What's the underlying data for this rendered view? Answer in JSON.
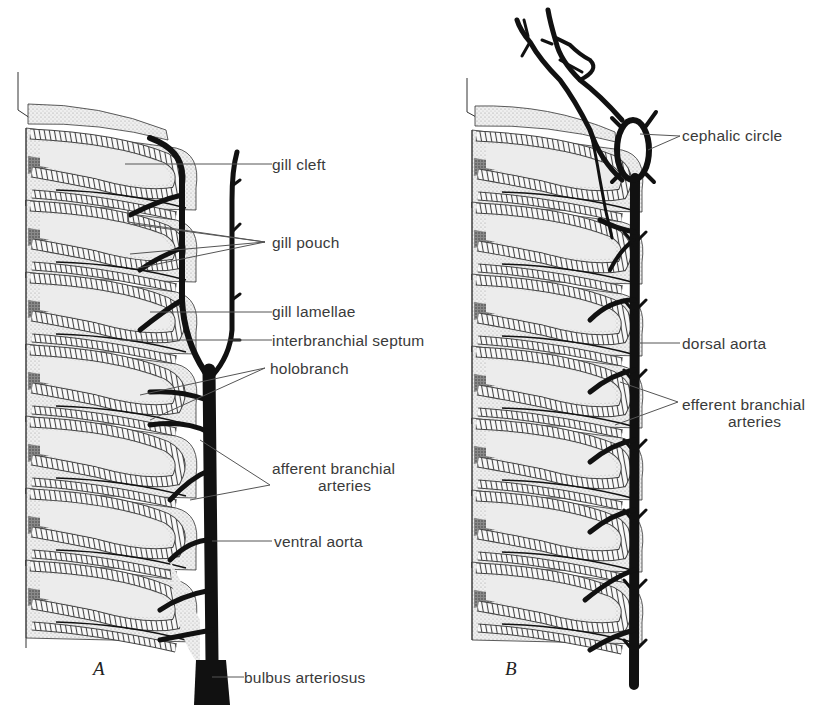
{
  "figure": {
    "panels": [
      {
        "letter": "A",
        "labels": {
          "gill_cleft": "gill cleft",
          "gill_pouch": "gill pouch",
          "gill_lamellae": "gill lamellae",
          "interbranchial_septum": "interbranchial septum",
          "holobranch": "holobranch",
          "afferent_line1": "afferent branchial",
          "afferent_line2": "arteries",
          "ventral_aorta": "ventral aorta",
          "bulbus_arteriosus": "bulbus arteriosus"
        }
      },
      {
        "letter": "B",
        "labels": {
          "cephalic_circle": "cephalic circle",
          "dorsal_aorta": "dorsal aorta",
          "efferent_line1": "efferent branchial",
          "efferent_line2": "arteries"
        }
      }
    ],
    "colors": {
      "ink": "#111111",
      "tissue": "#e6e6e6",
      "dark_tissue": "#7a7a7a",
      "leader": "#555555"
    }
  }
}
